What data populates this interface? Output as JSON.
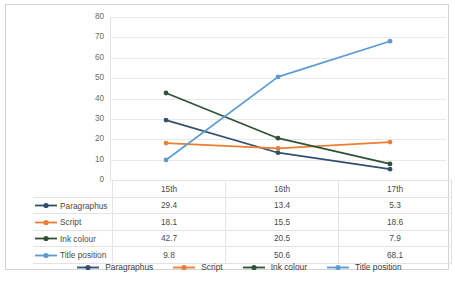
{
  "chart_data": {
    "type": "line",
    "title": "",
    "xlabel": "",
    "ylabel": "",
    "ylim": [
      0,
      80
    ],
    "ytick_step": 10,
    "yticks": [
      80,
      70,
      60,
      50,
      40,
      30,
      20,
      10,
      0
    ],
    "grid": true,
    "legend_position": "bottom",
    "has_data_table": true,
    "categories": [
      "15th",
      "16th",
      "17th"
    ],
    "series": [
      {
        "name": "Paragraphus",
        "values": [
          29.4,
          13.4,
          5.3
        ],
        "color": "#31506e"
      },
      {
        "name": "Script",
        "values": [
          18.1,
          15.5,
          18.6
        ],
        "color": "#ed7d31"
      },
      {
        "name": "Ink colour",
        "values": [
          42.7,
          20.5,
          7.9
        ],
        "color": "#2f5233"
      },
      {
        "name": "Title position",
        "values": [
          9.8,
          50.6,
          68.1
        ],
        "color": "#5b9bd5"
      }
    ]
  },
  "table": {
    "corner_label": "",
    "column_headers": [
      "15th",
      "16th",
      "17th"
    ],
    "rows": [
      {
        "label": "Paragraphus",
        "values": [
          "29.4",
          "13.4",
          "5.3"
        ]
      },
      {
        "label": "Script",
        "values": [
          "18.1",
          "15.5",
          "18.6"
        ]
      },
      {
        "label": "Ink colour",
        "values": [
          "42.7",
          "20.5",
          "7.9"
        ]
      },
      {
        "label": "Title position",
        "values": [
          "9.8",
          "50.6",
          "68.1"
        ]
      }
    ]
  },
  "legend": {
    "items": [
      "Paragraphus",
      "Script",
      "Ink colour",
      "Title position"
    ]
  },
  "caption": {
    "text": ""
  },
  "colors": {
    "paragraphus": "#31506e",
    "script": "#ed7d31",
    "ink_colour": "#2f5233",
    "title_position": "#5b9bd5",
    "gridline": "#e9e9e9",
    "frame": "#d2d2d2",
    "tick_text": "#6b6b6b"
  }
}
